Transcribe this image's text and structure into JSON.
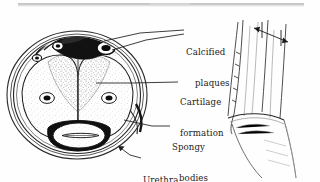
{
  "figure": {
    "medium": "scanned line drawing",
    "background_color": "#fefefe",
    "ink_color": "#1b1b1b"
  },
  "labels": [
    {
      "id": "calcified-plaques",
      "line1": "Calcified",
      "line2": "plaques",
      "x": 186,
      "y": 27
    },
    {
      "id": "cartilage-formation",
      "line1": "Cartilage",
      "line2": "formation",
      "x": 180,
      "y": 77
    },
    {
      "id": "spongy-bodies",
      "line1": "Spongy",
      "line2": "bodies",
      "x": 172,
      "y": 122
    },
    {
      "id": "urethra",
      "line1": "Urethra",
      "line2": "",
      "x": 143,
      "y": 155
    }
  ],
  "structures": [
    {
      "id": "tunica-albuginea",
      "description": "outer concentric ring of the cross-section"
    },
    {
      "id": "corpora-cavernosa",
      "description": "paired spongy bodies with central arteries"
    },
    {
      "id": "corpus-spongiosum",
      "description": "lower body enclosing the urethra"
    },
    {
      "id": "plaque-mass",
      "description": "dark calcified plaque at dorsal aspect"
    },
    {
      "id": "dorsal-vessels",
      "description": "small ringed vessels near dorsum"
    },
    {
      "id": "lateral-view-sketch",
      "description": "side view of shaft with measurement arrow"
    }
  ],
  "annotations": {
    "measure_arrow": "double-headed arrow across lateral sketch"
  }
}
